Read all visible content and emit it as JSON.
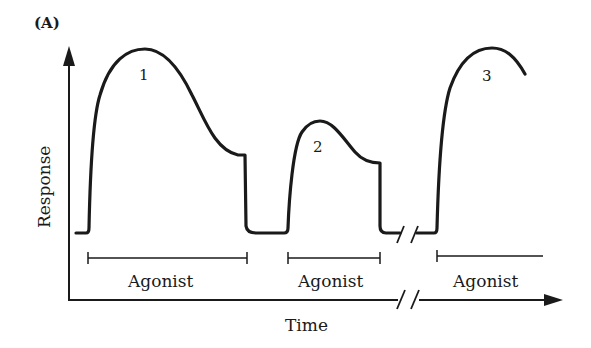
{
  "figure": {
    "panel_label": "(A)",
    "x_axis_label": "Time",
    "y_axis_label": "Response",
    "colors": {
      "ink": "#1a1a1a",
      "background": "#ffffff"
    },
    "responses": [
      {
        "id": "1",
        "label": "1",
        "description": "Large response with sag to plateau, then return to baseline on agonist removal"
      },
      {
        "id": "2",
        "label": "2",
        "description": "Smaller response with sag to plateau, then return to baseline"
      },
      {
        "id": "3",
        "label": "3",
        "description": "Recovered full response after time break"
      }
    ],
    "agonist_bars": [
      {
        "label": "Agonist"
      },
      {
        "label": "Agonist"
      },
      {
        "label": "Agonist"
      }
    ],
    "axis_break": "//"
  }
}
